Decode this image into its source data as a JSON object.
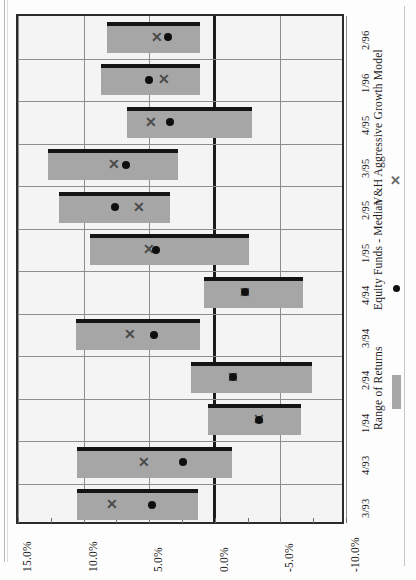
{
  "chart_data": {
    "type": "bar",
    "orientation": "rotated-90",
    "title": "",
    "xlabel": "",
    "ylabel": "",
    "categories": [
      "3/93",
      "4/93",
      "1/94",
      "2/94",
      "3/94",
      "4/94",
      "1/95",
      "2/95",
      "3/95",
      "4/95",
      "1/96",
      "2/96"
    ],
    "value_axis": {
      "ticks": [
        "15.0%",
        "10.0%",
        "5.0%",
        "0.0%",
        "-5.0%",
        "-10.0%"
      ],
      "tick_values": [
        15.0,
        10.0,
        5.0,
        0.0,
        -5.0,
        -10.0
      ],
      "lim": [
        15.0,
        -10.0
      ],
      "grid": true,
      "zero_line": 0.0,
      "unit": "%"
    },
    "series": [
      {
        "name": "Range of Returns",
        "marker": "bar",
        "color": "#a6a6a6",
        "ranges": [
          {
            "category": "3/93",
            "high": 10.5,
            "low": 1.3
          },
          {
            "category": "4/93",
            "high": 10.5,
            "low": -1.3
          },
          {
            "category": "1/94",
            "high": 0.5,
            "low": -6.6
          },
          {
            "category": "2/94",
            "high": 1.8,
            "low": -7.4
          },
          {
            "category": "3/94",
            "high": 10.6,
            "low": 1.1
          },
          {
            "category": "4/94",
            "high": 0.8,
            "low": -6.7
          },
          {
            "category": "1/95",
            "high": 9.5,
            "low": -2.6
          },
          {
            "category": "2/95",
            "high": 11.9,
            "low": 3.4
          },
          {
            "category": "3/95",
            "high": 12.7,
            "low": 2.8
          },
          {
            "category": "4/95",
            "high": 6.7,
            "low": -2.8
          },
          {
            "category": "1/96",
            "high": 8.7,
            "low": 1.1
          },
          {
            "category": "2/96",
            "high": 8.2,
            "low": 1.1
          }
        ]
      },
      {
        "name": "Equity Funds - Median",
        "marker": "dot",
        "color": "#0f0f0f",
        "values": [
          4.8,
          2.4,
          -3.4,
          -1.4,
          4.6,
          -2.3,
          4.5,
          7.6,
          6.8,
          3.4,
          5.0,
          3.6
        ]
      },
      {
        "name": "V&H Aggressive Growth Model",
        "marker": "cross",
        "color": "#6a6a6a",
        "values": [
          7.8,
          5.4,
          -3.4,
          -1.4,
          6.5,
          -2.3,
          5.0,
          5.8,
          7.7,
          4.9,
          3.9,
          4.4
        ]
      }
    ],
    "legend": {
      "position": "right",
      "entries": [
        {
          "label": "Range of Returns",
          "marker": "bar"
        },
        {
          "label": "Equity Funds - Median",
          "marker": "dot"
        },
        {
          "label": "V&H Aggressive Growth Model",
          "marker": "cross"
        }
      ]
    }
  }
}
